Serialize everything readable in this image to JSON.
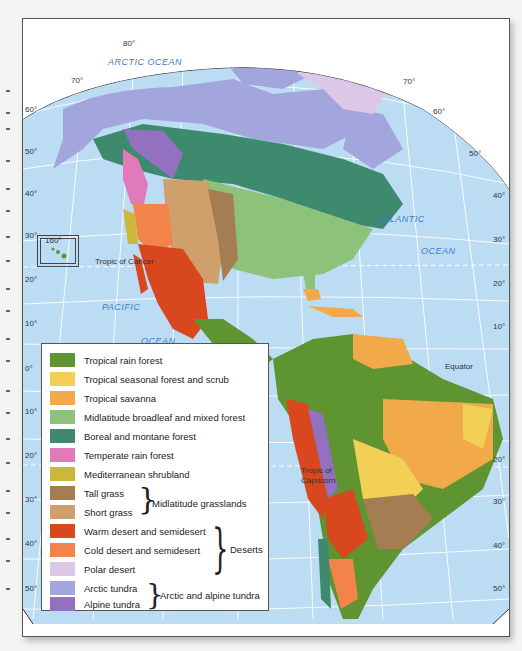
{
  "map": {
    "title": "Biomes of the Americas",
    "oceans": {
      "arctic": "ARCTIC OCEAN",
      "atlantic_1": "ATLANTIC",
      "atlantic_2": "OCEAN",
      "pacific_1": "PACIFIC",
      "pacific_2": "OCEAN"
    },
    "lines": {
      "tropic_cancer": "Tropic of Cancer",
      "tropic_capricorn_1": "Tropic of",
      "tropic_capricorn_2": "Capricorn",
      "equator": "Equator"
    },
    "inset_label": "160°",
    "lat_labels_left": [
      "60°",
      "50°",
      "40°",
      "30°",
      "20°",
      "10°",
      "0°",
      "10°",
      "20°",
      "30°",
      "40°",
      "50°"
    ],
    "lat_labels_right": [
      "60°",
      "50°",
      "40°",
      "30°",
      "20°",
      "10°",
      "20°",
      "30°",
      "40°",
      "50°"
    ],
    "arc_labels": {
      "top_80": "80°",
      "top_70_left": "70°",
      "top_70_right": "70°"
    },
    "colors": {
      "ocean": "#bcdcf3",
      "grid": "#ffffff",
      "border": "#2a2a2a"
    }
  },
  "legend": {
    "items": [
      {
        "label": "Tropical rain forest",
        "color": "#5e9530"
      },
      {
        "label": "Tropical seasonal forest and scrub",
        "color": "#f2cf55"
      },
      {
        "label": "Tropical savanna",
        "color": "#f2a94a"
      },
      {
        "label": "Midlatitude broadleaf and mixed forest",
        "color": "#8dc27a"
      },
      {
        "label": "Boreal and montane forest",
        "color": "#3d8a6f"
      },
      {
        "label": "Temperate rain forest",
        "color": "#e07ab8"
      },
      {
        "label": "Mediterranean shrubland",
        "color": "#c9b83a"
      },
      {
        "label": "Tall grass",
        "color": "#a47d52"
      },
      {
        "label": "Short grass",
        "color": "#cf9f6c"
      },
      {
        "label": "Warm desert and semidesert",
        "color": "#d9471f"
      },
      {
        "label": "Cold desert and semidesert",
        "color": "#f2844a"
      },
      {
        "label": "Polar desert",
        "color": "#dcc8e6"
      },
      {
        "label": "Arctic tundra",
        "color": "#a2a6dc"
      },
      {
        "label": "Alpine tundra",
        "color": "#9470c0"
      }
    ],
    "groups": {
      "grasslands": "Midlatitude grasslands",
      "deserts": "Deserts",
      "tundra": "Arctic and alpine tundra"
    }
  }
}
